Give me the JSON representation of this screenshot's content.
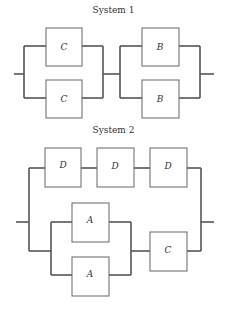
{
  "systems": [
    {
      "title": "System 1",
      "structure": "series of two parallel blocks",
      "blocks": [
        {
          "type": "parallel",
          "components": [
            "C",
            "C"
          ]
        },
        {
          "type": "parallel",
          "components": [
            "B",
            "B"
          ]
        }
      ]
    },
    {
      "title": "System 2",
      "structure": "parallel of two paths",
      "paths": [
        {
          "type": "series",
          "components": [
            "D",
            "D",
            "D"
          ]
        },
        {
          "type": "series",
          "components": [
            {
              "type": "parallel",
              "components": [
                "A",
                "A"
              ]
            },
            "C"
          ]
        }
      ]
    }
  ],
  "labels": {
    "s1_c1": "C",
    "s1_c2": "C",
    "s1_b1": "B",
    "s1_b2": "B",
    "s2_d1": "D",
    "s2_d2": "D",
    "s2_d3": "D",
    "s2_a1": "A",
    "s2_a2": "A",
    "s2_c": "C"
  },
  "colors": {
    "line": "#555555",
    "box_border": "#666666",
    "background": "#ffffff"
  }
}
